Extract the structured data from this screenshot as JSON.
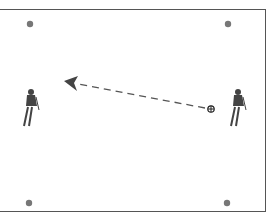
{
  "diagram": {
    "type": "soccer-drill",
    "colors": {
      "cone": "#777777",
      "line": "#555555",
      "border": "#555555",
      "player": "#444444"
    },
    "cones": [
      {
        "x": 30,
        "y": 24
      },
      {
        "x": 228,
        "y": 24
      },
      {
        "x": 29,
        "y": 203
      },
      {
        "x": 227,
        "y": 203
      }
    ],
    "players": [
      {
        "name": "left-player",
        "x": 28,
        "y": 107
      },
      {
        "name": "right-player",
        "x": 236,
        "y": 107
      }
    ],
    "ball": {
      "x": 211,
      "y": 109
    },
    "pass": {
      "from": [
        205,
        108
      ],
      "to": [
        70,
        83
      ],
      "style": "dashed"
    }
  }
}
